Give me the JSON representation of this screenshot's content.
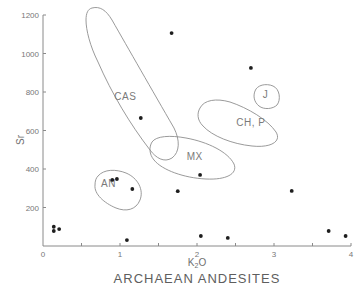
{
  "chart_data": {
    "type": "scatter",
    "title": "ARCHAEAN ANDESITES",
    "xlabel": "K2O",
    "xlabel_display": {
      "base": "K",
      "sub": "2",
      "tail": "O"
    },
    "ylabel": "Sr",
    "xlim": [
      0,
      4
    ],
    "ylim": [
      0,
      1200
    ],
    "grid": false,
    "x_ticks": [
      {
        "value": 0,
        "label": "0",
        "labeled": true
      },
      {
        "value": 0.5,
        "label": "",
        "labeled": false
      },
      {
        "value": 1,
        "label": "1",
        "labeled": true
      },
      {
        "value": 1.5,
        "label": "",
        "labeled": false
      },
      {
        "value": 2,
        "label": "2",
        "labeled": true
      },
      {
        "value": 2.5,
        "label": "",
        "labeled": false
      },
      {
        "value": 3,
        "label": "3",
        "labeled": true
      },
      {
        "value": 3.5,
        "label": "",
        "labeled": false
      },
      {
        "value": 4,
        "label": "4",
        "labeled": true
      }
    ],
    "y_ticks": [
      {
        "value": 200,
        "label": "200"
      },
      {
        "value": 400,
        "label": "400"
      },
      {
        "value": 600,
        "label": "600"
      },
      {
        "value": 800,
        "label": "800"
      },
      {
        "value": 1000,
        "label": "1000"
      },
      {
        "value": 1200,
        "label": "1200"
      }
    ],
    "series": [
      {
        "name": "Archaean andesites",
        "points": [
          {
            "x": 0.14,
            "y": 100
          },
          {
            "x": 0.14,
            "y": 78
          },
          {
            "x": 0.21,
            "y": 88
          },
          {
            "x": 0.9,
            "y": 343
          },
          {
            "x": 0.96,
            "y": 348
          },
          {
            "x": 1.16,
            "y": 296
          },
          {
            "x": 1.09,
            "y": 31
          },
          {
            "x": 1.27,
            "y": 665
          },
          {
            "x": 1.67,
            "y": 1106
          },
          {
            "x": 1.75,
            "y": 285
          },
          {
            "x": 2.04,
            "y": 369
          },
          {
            "x": 2.05,
            "y": 52
          },
          {
            "x": 2.4,
            "y": 42
          },
          {
            "x": 2.7,
            "y": 925
          },
          {
            "x": 3.23,
            "y": 286
          },
          {
            "x": 3.71,
            "y": 78
          },
          {
            "x": 3.93,
            "y": 52
          }
        ]
      }
    ],
    "fields": [
      {
        "name": "CAS",
        "label": "CAS",
        "label_at": {
          "x": 1.07,
          "y": 760
        },
        "outline": "M92,8 C100,6 106,10 112,20 C128,48 152,90 174,128 C180,140 180,152 172,158 C164,163 156,158 150,150 C130,124 112,94 98,62 C90,46 86,30 86,20 C86,13 88,9 92,8 Z"
      },
      {
        "name": "MX",
        "label": "MX",
        "label_at": {
          "x": 1.97,
          "y": 445
        },
        "outline": "M152,142 C156,136 170,135 186,138 C208,142 228,152 234,164 C238,174 226,180 206,179 C184,178 162,170 154,160 C149,154 149,147 152,142 Z"
      },
      {
        "name": "CH, P",
        "label": "CH, P",
        "label_at": {
          "x": 2.7,
          "y": 625
        },
        "outline": "M200,108 C204,100 216,98 230,102 C248,108 268,120 276,132 C282,142 270,148 252,146 C232,144 212,136 203,126 C197,120 197,113 200,108 Z"
      },
      {
        "name": "J",
        "label": "J",
        "label_at": {
          "x": 2.89,
          "y": 770
        },
        "outline": "M255,91 C257,85 266,83 273,86 C280,89 281,100 277,105 C273,109 264,110 259,106 C254,102 253,96 255,91 Z"
      },
      {
        "name": "AN",
        "label": "AN",
        "label_at": {
          "x": 0.85,
          "y": 305
        },
        "outline": "M98,176 C104,169 116,169 126,173 C138,178 144,190 140,200 C136,210 126,212 116,208 C104,203 94,194 95,185 C95,181 96,178 98,176 Z"
      }
    ]
  }
}
